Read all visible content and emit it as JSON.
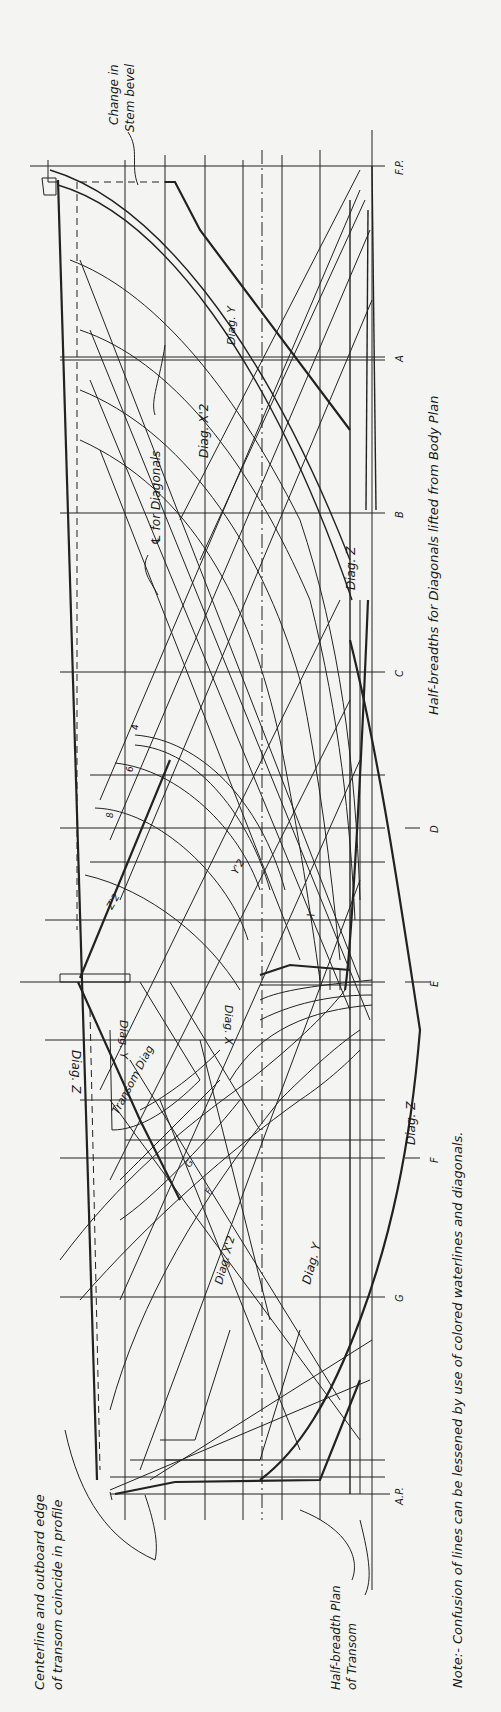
{
  "drawing": {
    "title": "Lines drawing — diagonals and half-breadth plan",
    "colors": {
      "paper": "#f4f4f2",
      "ink": "#222222"
    },
    "stations": [
      {
        "id": "fp",
        "label": "F.P.",
        "y": 166
      },
      {
        "id": "a",
        "label": "A",
        "y": 357
      },
      {
        "id": "b",
        "label": "B",
        "y": 513
      },
      {
        "id": "c",
        "label": "C",
        "y": 672
      },
      {
        "id": "d",
        "label": "D",
        "y": 828
      },
      {
        "id": "e",
        "label": "E",
        "y": 982
      },
      {
        "id": "f",
        "label": "F",
        "y": 1158
      },
      {
        "id": "g",
        "label": "G",
        "y": 1297
      },
      {
        "id": "ap",
        "label": "A.P.",
        "y": 1494
      }
    ],
    "diagonal_labels": {
      "diag_z_top": "Diag. Z",
      "diag_y_top": "Diag. Y",
      "diag_x2_top": "Diag. X'2",
      "diag_z_mid": "Diag. Z",
      "transom_diag": "Transom Diag",
      "diag_y_mid": "Diag. Y",
      "diag_x_mid": "Diag. X",
      "diag_z_low": "Diag. Z",
      "diag_x2_low": "Diag. X'2",
      "diag_y_low": "Diag. Y",
      "z2": "Z'2",
      "y2": "Y'2",
      "x_mark": "X",
      "y_mark": "Y",
      "f_mark": "F",
      "g_mark": "G",
      "arc_marks": [
        "4",
        "6",
        "8"
      ]
    },
    "annotations": {
      "stem_bevel": [
        "Change in",
        "Stem bevel"
      ],
      "cl_diagonals": "℄ for Diagonals",
      "half_breadths": "Half-breadths for Diagonals lifted from Body Plan",
      "centerline_transom": [
        "Centerline and outboard edge",
        "of transom coincide in profile"
      ],
      "half_breadth_transom": [
        "Half-breadth Plan",
        "of Transom"
      ],
      "note": "Note:- Confusion of lines can be lessened by use of colored waterlines and diagonals."
    }
  }
}
